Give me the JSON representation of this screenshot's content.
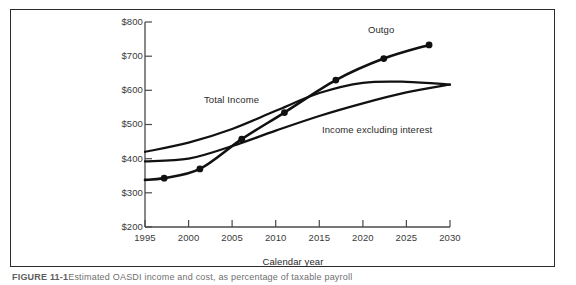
{
  "figure": {
    "caption_bold": "FIGURE 11-1",
    "caption_rest": "Estimated OASDI income and cost, as percentage of taxable payroll"
  },
  "chart_data": {
    "type": "line",
    "title": "",
    "xlabel": "Calendar year",
    "ylabel": "",
    "xlim": [
      1995,
      2030
    ],
    "ylim": [
      200,
      800
    ],
    "xticks": [
      1995,
      2000,
      2005,
      2010,
      2015,
      2020,
      2025,
      2030
    ],
    "yticks": [
      200,
      300,
      400,
      500,
      600,
      700,
      800
    ],
    "ytick_labels": [
      "$200",
      "$300",
      "$400",
      "$500",
      "$600",
      "$700",
      "$800"
    ],
    "xtick_labels": [
      "1995",
      "2000",
      "2005",
      "2010",
      "2015",
      "2020",
      "2025",
      "2030"
    ],
    "grid": false,
    "legend_position": "inline-annotations",
    "series": [
      {
        "name": "Outgo",
        "marker": "filled-circle",
        "x": [
          1995,
          1997.2,
          2001.3,
          2006.1,
          2011.0,
          2016.9,
          2022.4,
          2027.6
        ],
        "values": [
          338,
          343,
          370,
          457,
          535,
          630,
          693,
          733
        ],
        "marker_x": [
          1997.2,
          2001.3,
          2006.1,
          2011.0,
          2016.9,
          2022.4,
          2027.6
        ],
        "marker_values": [
          343,
          370,
          457,
          535,
          630,
          693,
          733
        ]
      },
      {
        "name": "Total Income",
        "marker": "none",
        "x": [
          1995,
          2000,
          2005,
          2010,
          2015,
          2020,
          2025,
          2030
        ],
        "values": [
          420,
          447,
          487,
          540,
          592,
          622,
          625,
          617
        ]
      },
      {
        "name": "Income excluding interest",
        "marker": "none",
        "x": [
          1995,
          2000,
          2005,
          2010,
          2015,
          2020,
          2025,
          2030
        ],
        "values": [
          392,
          400,
          437,
          482,
          525,
          562,
          594,
          617
        ]
      }
    ],
    "annotations": [
      {
        "text": "Outgo",
        "x": 2021.5,
        "y": 780
      },
      {
        "text": "Total Income",
        "x": 2002.0,
        "y": 592
      },
      {
        "text": "Income excluding interest",
        "x": 2015.4,
        "y": 500
      }
    ]
  }
}
